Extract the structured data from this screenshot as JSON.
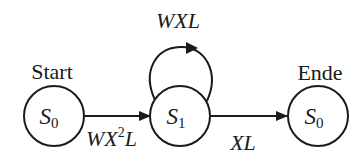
{
  "diagram": {
    "type": "state-transition",
    "colors": {
      "stroke": "#1a1a1a",
      "background": "#ffffff"
    },
    "nodes": [
      {
        "id": "start",
        "caption": "Start",
        "symbol": "S",
        "subscript": "0"
      },
      {
        "id": "s1",
        "caption": "",
        "symbol": "S",
        "subscript": "1"
      },
      {
        "id": "end",
        "caption": "Ende",
        "symbol": "S",
        "subscript": "0"
      }
    ],
    "edges": [
      {
        "from": "start",
        "to": "s1",
        "label_pre": "WX",
        "label_sup": "2",
        "label_post": "L"
      },
      {
        "from": "s1",
        "to": "s1",
        "label": "WXL"
      },
      {
        "from": "s1",
        "to": "end",
        "label": "XL"
      }
    ]
  }
}
